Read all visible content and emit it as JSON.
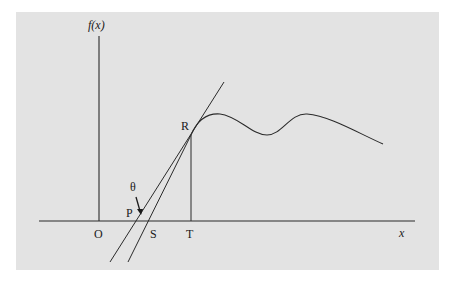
{
  "diagram": {
    "labels": {
      "y_axis": "f(x)",
      "x_axis": "x",
      "origin": "O",
      "point_p": "P",
      "point_s": "S",
      "point_t": "T",
      "point_r": "R",
      "angle": "θ"
    },
    "colors": {
      "background": "#e3e3e3",
      "stroke": "#2a2a2a"
    }
  }
}
